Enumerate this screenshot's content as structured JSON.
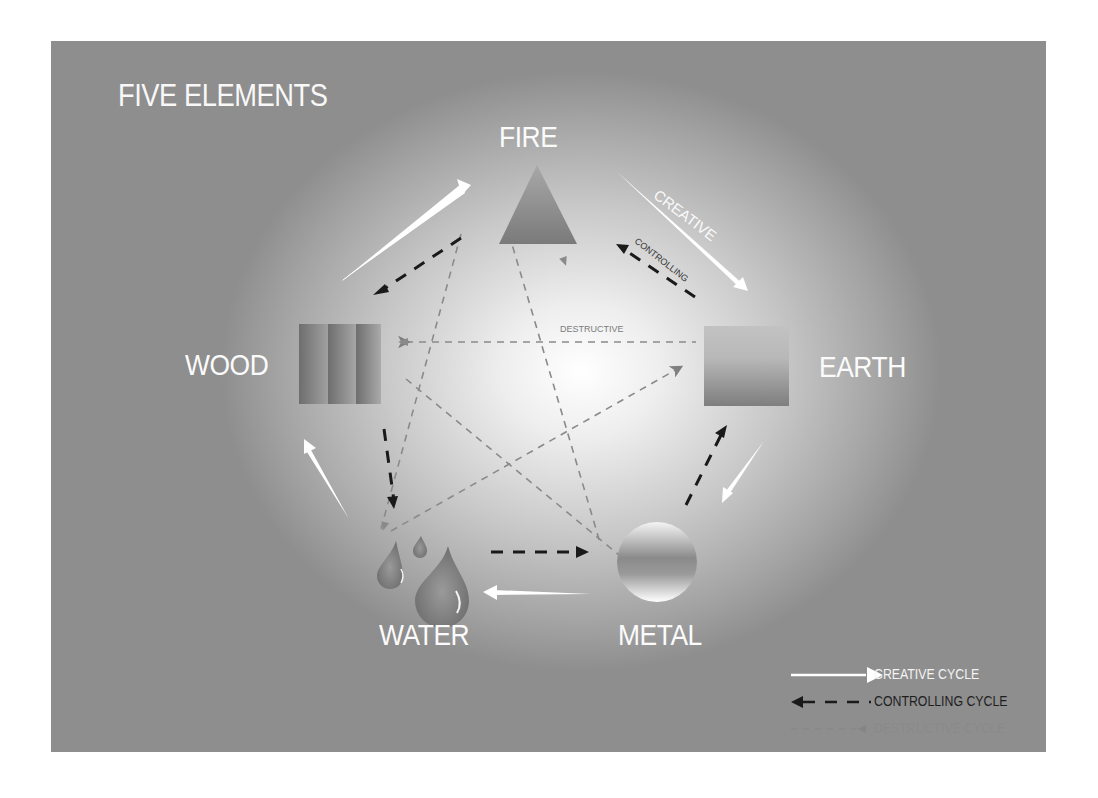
{
  "title": "FIVE ELEMENTS",
  "elements": [
    {
      "name": "FIRE",
      "shape": "triangle"
    },
    {
      "name": "EARTH",
      "shape": "square"
    },
    {
      "name": "METAL",
      "shape": "circle"
    },
    {
      "name": "WATER",
      "shape": "droplets"
    },
    {
      "name": "WOOD",
      "shape": "striped-rectangle"
    }
  ],
  "annotations": {
    "creative": "CREATIVE",
    "controlling": "CONTROLLING",
    "destructive": "DESTRUCTIVE"
  },
  "legend": [
    {
      "label": "CREATIVE CYCLE",
      "style": "solid-white-arrow",
      "color": "#ffffff"
    },
    {
      "label": "CONTROLLING CYCLE",
      "style": "dashed-black-arrow",
      "color": "#1a1a1a"
    },
    {
      "label": "DESTRUCTIVE CYCLE",
      "style": "dashed-gray-arrow",
      "color": "#7a7a7a"
    }
  ],
  "cycles": {
    "creative": [
      "WOOD",
      "FIRE",
      "EARTH",
      "METAL",
      "WATER",
      "WOOD"
    ],
    "controlling": [
      "EARTH",
      "FIRE",
      "WOOD",
      "WATER",
      "METAL",
      "EARTH"
    ],
    "destructive": [
      "WOOD",
      "EARTH",
      "WATER",
      "FIRE",
      "METAL",
      "WOOD"
    ]
  },
  "colors": {
    "background_center": "#ffffff",
    "background_edge": "#8e8e8e",
    "label_text": "#fbfbfb",
    "shape_fill": "#8a8a8a"
  }
}
